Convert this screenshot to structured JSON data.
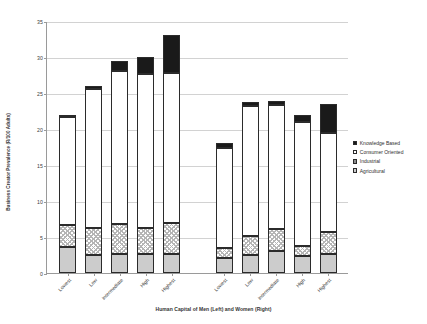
{
  "chart_data": {
    "type": "bar",
    "title": "",
    "xlabel": "Human Capital of Men (Left) and Women (Right)",
    "ylabel": "Business Creator Prevalence (R/100 Adults)",
    "ylim": [
      0,
      35
    ],
    "yticks": [
      0,
      5,
      10,
      15,
      20,
      25,
      30,
      35
    ],
    "grid": true,
    "stacked": true,
    "legend_position": "right",
    "groups": [
      "Men (Left)",
      "Women (Right)"
    ],
    "categories": [
      "Lowest",
      "Low",
      "Intermediate",
      "High",
      "Highest"
    ],
    "series": [
      {
        "name": "Agricultural",
        "color": "#cccccc",
        "values_men": [
          3.6,
          2.5,
          2.6,
          2.7,
          2.6
        ],
        "values_women": [
          2.1,
          2.5,
          3.0,
          2.3,
          2.7
        ]
      },
      {
        "name": "Industrial",
        "color": "#ffffff",
        "pattern": "checkered",
        "values_men": [
          3.0,
          3.7,
          4.2,
          3.5,
          4.3
        ],
        "values_women": [
          1.4,
          2.6,
          3.1,
          1.5,
          3.0
        ]
      },
      {
        "name": "Consumer Oriented",
        "color": "#ffffff",
        "values_men": [
          15.0,
          19.4,
          21.2,
          21.4,
          20.9
        ],
        "values_women": [
          13.9,
          18.1,
          17.3,
          17.2,
          13.8
        ]
      },
      {
        "name": "Knowledge Based",
        "color": "#1a1a1a",
        "values_men": [
          0.4,
          0.4,
          1.5,
          2.4,
          5.2
        ],
        "values_women": [
          0.6,
          0.6,
          0.5,
          1.0,
          4.0
        ]
      }
    ],
    "totals_men": [
      22.0,
      26.0,
      29.5,
      30.0,
      33.0
    ],
    "totals_women": [
      18.0,
      23.8,
      23.9,
      22.0,
      23.5
    ]
  },
  "legend": {
    "items": [
      {
        "label": "Knowledge Based",
        "swatch": "know"
      },
      {
        "label": "Consumer Oriented",
        "swatch": "cons"
      },
      {
        "label": "Industrial",
        "swatch": "indus"
      },
      {
        "label": "Agricultural",
        "swatch": "agri"
      }
    ]
  }
}
